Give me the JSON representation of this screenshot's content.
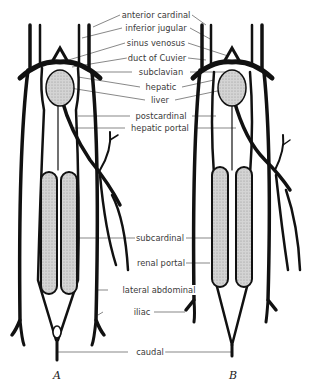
{
  "figure": {
    "panels": [
      {
        "id": "A",
        "label": "A",
        "x": 57,
        "y": 369
      },
      {
        "id": "B",
        "label": "B",
        "x": 233,
        "y": 369
      }
    ],
    "labels": [
      {
        "text": "anterior cardinal",
        "x": 156,
        "y": 10
      },
      {
        "text": "inferior jugular",
        "x": 156,
        "y": 23
      },
      {
        "text": "sinus venosus",
        "x": 156,
        "y": 38
      },
      {
        "text": "duct of Cuvier",
        "x": 157,
        "y": 53
      },
      {
        "text": "subclavian",
        "x": 161,
        "y": 67
      },
      {
        "text": "hepatic",
        "x": 161,
        "y": 82
      },
      {
        "text": "liver",
        "x": 160,
        "y": 95
      },
      {
        "text": "postcardinal",
        "x": 161,
        "y": 111
      },
      {
        "text": "hepatic portal",
        "x": 160,
        "y": 123
      },
      {
        "text": "subcardinal",
        "x": 160,
        "y": 233
      },
      {
        "text": "renal portal",
        "x": 161,
        "y": 258
      },
      {
        "text": "lateral abdominal",
        "x": 159,
        "y": 285
      },
      {
        "text": "iliac",
        "x": 142,
        "y": 307
      },
      {
        "text": "caudal",
        "x": 150,
        "y": 347
      }
    ],
    "colors": {
      "line": "#111111",
      "stipple": "#c8c8c8",
      "label": "#3a3a3a"
    }
  }
}
